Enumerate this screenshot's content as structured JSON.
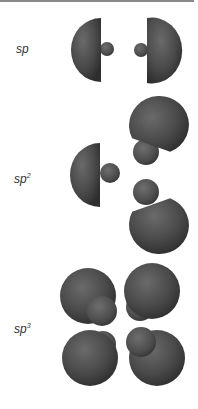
{
  "figure": {
    "rows": [
      {
        "base": "sp",
        "exponent": "",
        "lobes": 2
      },
      {
        "base": "sp",
        "exponent": "2",
        "lobes": 3
      },
      {
        "base": "sp",
        "exponent": "3",
        "lobes": 4
      }
    ]
  },
  "colors": {
    "lobe_dark": "#3a3a3a",
    "lobe_mid": "#555555",
    "lobe_light": "#6e6e6e",
    "topbar": "#8a8a8a"
  }
}
